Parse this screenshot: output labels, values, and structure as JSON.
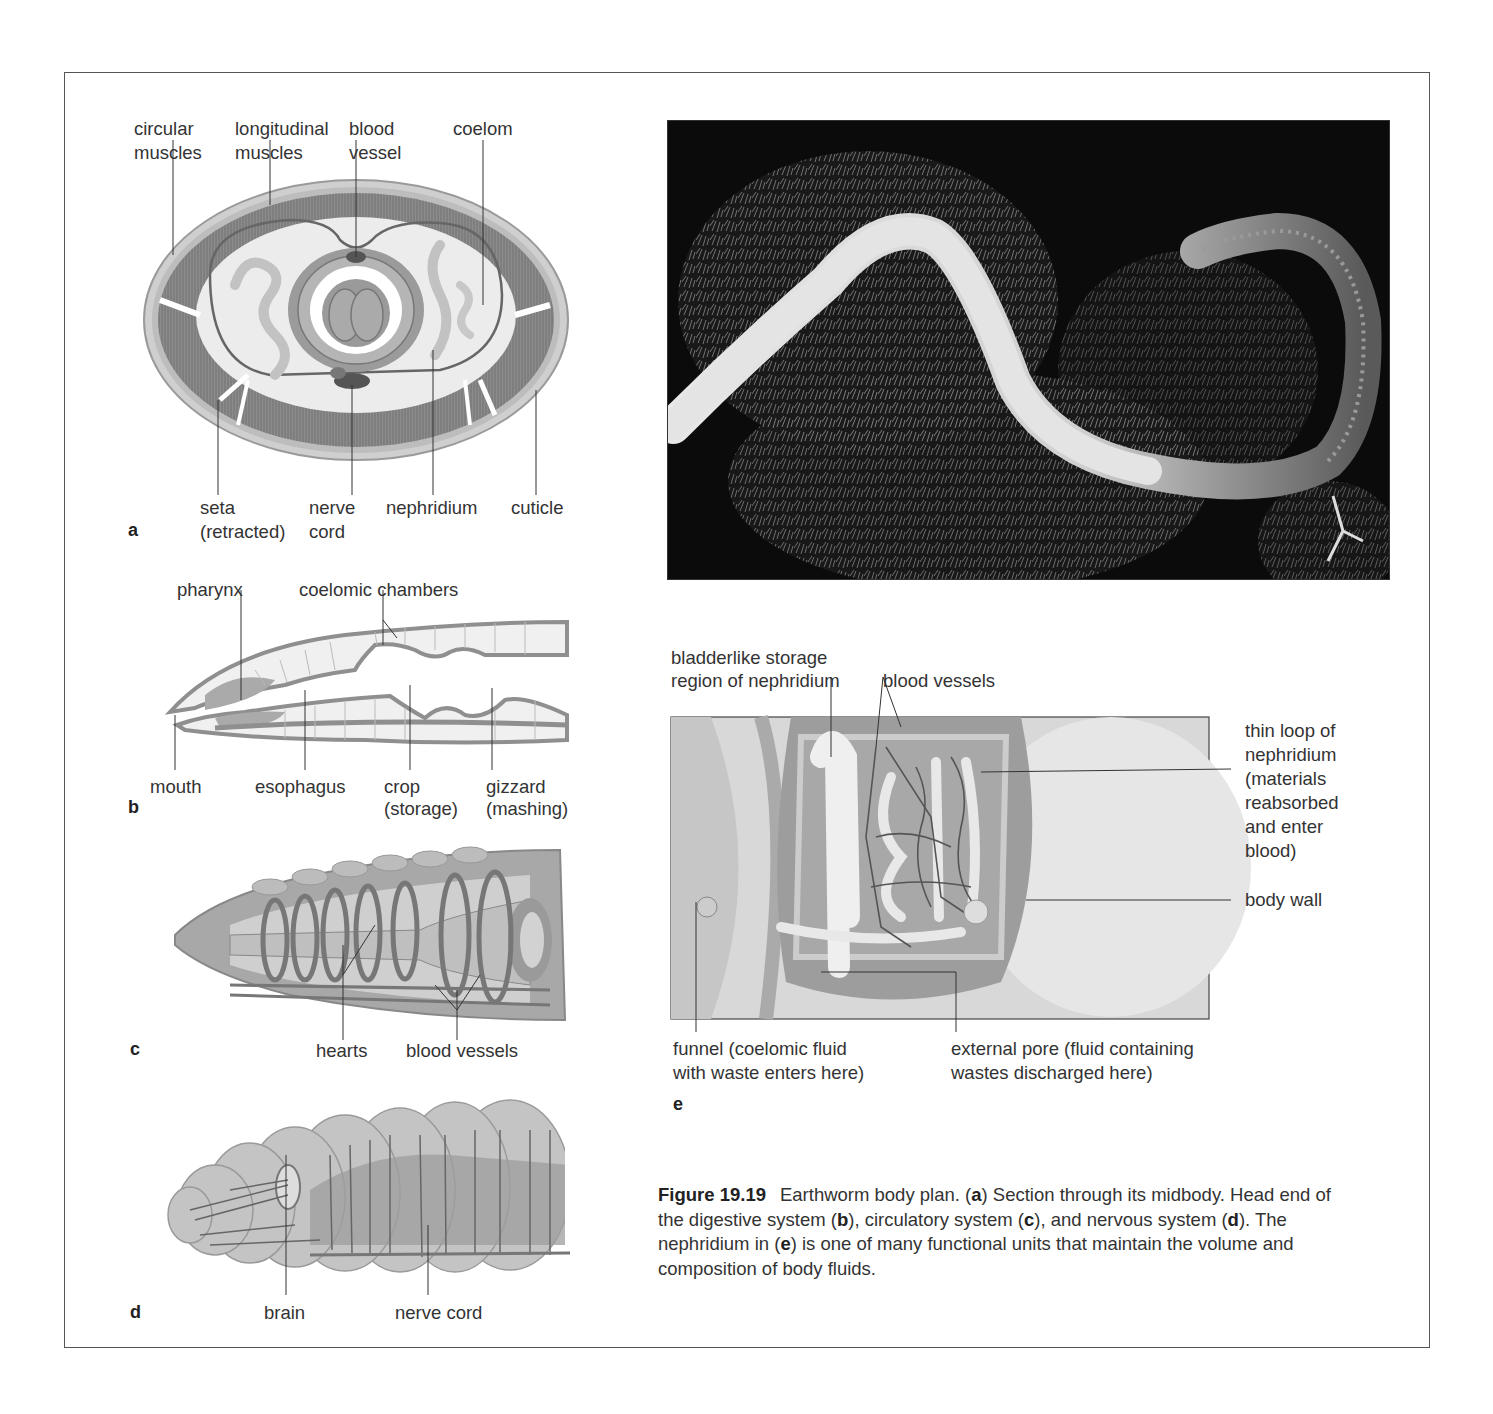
{
  "figure": {
    "number": "Figure 19.19",
    "title": "Earthworm body plan.",
    "caption_parts": {
      "p1": " (",
      "a": "a",
      "p2": ") Section through its midbody. Head end of the digestive system (",
      "b": "b",
      "p3": "), circulatory system (",
      "c": "c",
      "p4": "), and nervous system (",
      "d": "d",
      "p5": "). The nephridium in (",
      "e": "e",
      "p6": ") is one of many functional units that maintain the volume and composition of body fluids."
    }
  },
  "panels": {
    "a": {
      "letter": "a",
      "title": "Cross section through midbody",
      "labels": {
        "circular_muscles_1": "circular",
        "circular_muscles_2": "muscles",
        "longitudinal_muscles_1": "longitudinal",
        "longitudinal_muscles_2": "muscles",
        "blood_vessel_1": "blood",
        "blood_vessel_2": "vessel",
        "coelom": "coelom",
        "seta_1": "seta",
        "seta_2": "(retracted)",
        "nerve_cord_1": "nerve",
        "nerve_cord_2": "cord",
        "nephridium": "nephridium",
        "cuticle": "cuticle"
      }
    },
    "b": {
      "letter": "b",
      "title": "Head end of digestive system",
      "labels": {
        "pharynx": "pharynx",
        "coelomic_chambers": "coelomic chambers",
        "mouth": "mouth",
        "esophagus": "esophagus",
        "crop_1": "crop",
        "crop_2": "(storage)",
        "gizzard_1": "gizzard",
        "gizzard_2": "(mashing)"
      }
    },
    "c": {
      "letter": "c",
      "title": "Circulatory system",
      "labels": {
        "hearts": "hearts",
        "blood_vessels": "blood vessels"
      }
    },
    "d": {
      "letter": "d",
      "title": "Nervous system",
      "labels": {
        "brain": "brain",
        "nerve_cord": "nerve cord"
      }
    },
    "photo": {
      "description": "Photograph of an earthworm on moss"
    },
    "e": {
      "letter": "e",
      "title": "Nephridium",
      "labels": {
        "bladder_1": "bladderlike storage",
        "bladder_2": "region of nephridium",
        "blood_vessels": "blood vessels",
        "thin_loop_1": "thin loop of",
        "thin_loop_2": "nephridium",
        "thin_loop_3": "(materials",
        "thin_loop_4": "reabsorbed",
        "thin_loop_5": "and enter",
        "thin_loop_6": "blood)",
        "body_wall": "body wall",
        "funnel_1": "funnel (coelomic fluid",
        "funnel_2": "with waste enters here)",
        "pore_1": "external pore (fluid containing",
        "pore_2": "wastes discharged here)"
      }
    }
  },
  "colors": {
    "frame": "#555555",
    "text": "#333333",
    "muscle": "#8a8a8a",
    "tissue_light": "#e6e6e6",
    "photo_bg": "#0b0b0b"
  }
}
